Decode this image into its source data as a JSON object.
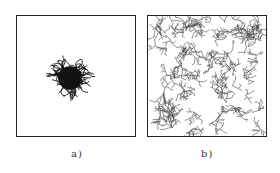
{
  "figure": {
    "panels": [
      {
        "id": "a",
        "caption": "a)",
        "description": "Compact dense dendritic aggregate cluster at center",
        "cluster": {
          "cx": 54,
          "cy": 63,
          "r": 16,
          "branches": 70,
          "color": "#111111"
        }
      },
      {
        "id": "b",
        "caption": "b)",
        "description": "Sparse branched dendritic network filling the whole domain",
        "network": {
          "seeds": 90,
          "color": "#444444"
        }
      }
    ]
  }
}
